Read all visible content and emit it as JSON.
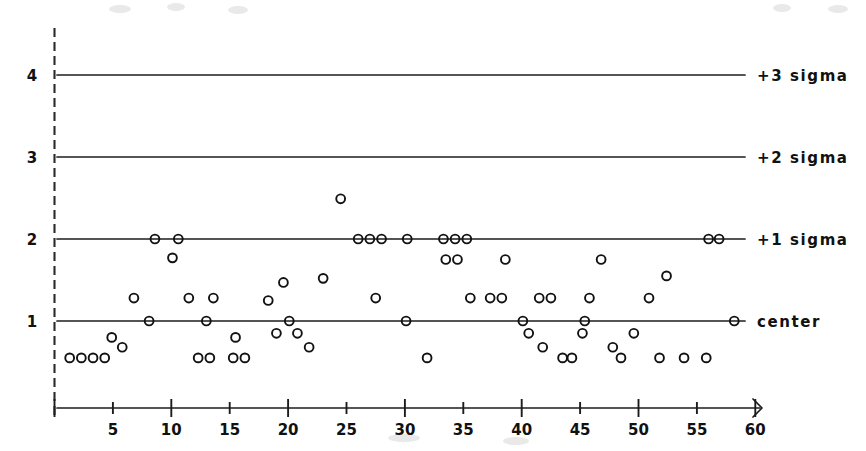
{
  "chart_data": {
    "type": "scatter",
    "title": "",
    "subtitle": "",
    "xlabel": "",
    "ylabel": "",
    "xlim": [
      0,
      62
    ],
    "ylim": [
      0.28,
      4.6
    ],
    "grid": false,
    "legend_position": "right-inline",
    "x_ticks_major": [
      0,
      10,
      20,
      30,
      40,
      50,
      60
    ],
    "x_ticks_minor": [
      5,
      15,
      25,
      35,
      45,
      55
    ],
    "x_tick_labels": [
      "5",
      "10",
      "15",
      "20",
      "25",
      "30",
      "35",
      "40",
      "45",
      "50",
      "55",
      "60"
    ],
    "x_tick_label_values": [
      5,
      10,
      15,
      20,
      25,
      30,
      35,
      40,
      45,
      50,
      55,
      60
    ],
    "y_tick_labels": [
      "1",
      "2",
      "3",
      "4"
    ],
    "y_tick_label_values": [
      1,
      2,
      3,
      4
    ],
    "axis_arrow": true,
    "control_lines": [
      {
        "id": "plus3sigma",
        "label": "+3 sigma",
        "value": 4
      },
      {
        "id": "plus2sigma",
        "label": "+2 sigma",
        "value": 3
      },
      {
        "id": "plus1sigma",
        "label": "+1 sigma",
        "value": 2
      },
      {
        "id": "center",
        "label": "center",
        "value": 1
      }
    ],
    "series": [
      {
        "name": "observations",
        "marker": "open-circle",
        "points": [
          {
            "x": 1.3,
            "y": 0.55
          },
          {
            "x": 2.3,
            "y": 0.55
          },
          {
            "x": 3.3,
            "y": 0.55
          },
          {
            "x": 4.3,
            "y": 0.55
          },
          {
            "x": 4.9,
            "y": 0.8
          },
          {
            "x": 5.8,
            "y": 0.68
          },
          {
            "x": 6.8,
            "y": 1.28
          },
          {
            "x": 8.6,
            "y": 2.0
          },
          {
            "x": 8.1,
            "y": 1.0
          },
          {
            "x": 10.6,
            "y": 2.0
          },
          {
            "x": 10.1,
            "y": 1.77
          },
          {
            "x": 11.5,
            "y": 1.28
          },
          {
            "x": 12.3,
            "y": 0.55
          },
          {
            "x": 13.3,
            "y": 0.55
          },
          {
            "x": 13.6,
            "y": 1.28
          },
          {
            "x": 13.0,
            "y": 1.0
          },
          {
            "x": 15.3,
            "y": 0.55
          },
          {
            "x": 16.3,
            "y": 0.55
          },
          {
            "x": 15.5,
            "y": 0.8
          },
          {
            "x": 18.3,
            "y": 1.25
          },
          {
            "x": 19.6,
            "y": 1.47
          },
          {
            "x": 19.0,
            "y": 0.85
          },
          {
            "x": 20.1,
            "y": 1.0
          },
          {
            "x": 20.8,
            "y": 0.85
          },
          {
            "x": 21.8,
            "y": 0.68
          },
          {
            "x": 23.0,
            "y": 1.52
          },
          {
            "x": 24.5,
            "y": 2.49
          },
          {
            "x": 26.0,
            "y": 2.0
          },
          {
            "x": 27.0,
            "y": 2.0
          },
          {
            "x": 28.0,
            "y": 2.0
          },
          {
            "x": 27.5,
            "y": 1.28
          },
          {
            "x": 30.2,
            "y": 2.0
          },
          {
            "x": 30.1,
            "y": 1.0
          },
          {
            "x": 31.9,
            "y": 0.55
          },
          {
            "x": 33.3,
            "y": 2.0
          },
          {
            "x": 34.3,
            "y": 2.0
          },
          {
            "x": 35.3,
            "y": 2.0
          },
          {
            "x": 33.5,
            "y": 1.75
          },
          {
            "x": 34.5,
            "y": 1.75
          },
          {
            "x": 35.6,
            "y": 1.28
          },
          {
            "x": 37.3,
            "y": 1.28
          },
          {
            "x": 38.3,
            "y": 1.28
          },
          {
            "x": 38.6,
            "y": 1.75
          },
          {
            "x": 40.1,
            "y": 1.0
          },
          {
            "x": 40.6,
            "y": 0.85
          },
          {
            "x": 41.5,
            "y": 1.28
          },
          {
            "x": 42.5,
            "y": 1.28
          },
          {
            "x": 41.8,
            "y": 0.68
          },
          {
            "x": 43.5,
            "y": 0.55
          },
          {
            "x": 44.3,
            "y": 0.55
          },
          {
            "x": 45.4,
            "y": 1.0
          },
          {
            "x": 45.2,
            "y": 0.85
          },
          {
            "x": 45.8,
            "y": 1.28
          },
          {
            "x": 46.8,
            "y": 1.75
          },
          {
            "x": 47.8,
            "y": 0.68
          },
          {
            "x": 48.5,
            "y": 0.55
          },
          {
            "x": 49.6,
            "y": 0.85
          },
          {
            "x": 50.9,
            "y": 1.28
          },
          {
            "x": 51.8,
            "y": 0.55
          },
          {
            "x": 52.4,
            "y": 1.55
          },
          {
            "x": 53.9,
            "y": 0.55
          },
          {
            "x": 56.0,
            "y": 2.0
          },
          {
            "x": 56.9,
            "y": 2.0
          },
          {
            "x": 55.8,
            "y": 0.55
          },
          {
            "x": 58.2,
            "y": 1.0
          }
        ]
      }
    ]
  },
  "chart_meta": {
    "marker_radius_px": 4.4,
    "stroke_color": "#121212"
  }
}
